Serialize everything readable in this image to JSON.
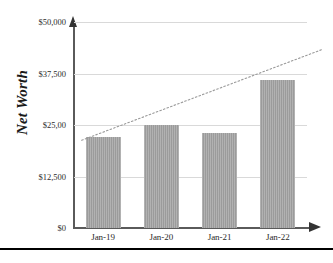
{
  "chart_data": {
    "type": "bar",
    "title": "",
    "subtitle": "",
    "xlabel": "",
    "ylabel": "Net Worth",
    "categories": [
      "Jan-19",
      "Jan-20",
      "Jan-21",
      "Jan-22"
    ],
    "values": [
      22000,
      25000,
      23000,
      36000
    ],
    "series": [
      {
        "name": "Net Worth",
        "values": [
          22000,
          25000,
          23000,
          36000
        ]
      }
    ],
    "ylim": [
      0,
      50000
    ],
    "ytick_values": [
      0,
      12500,
      25000,
      37500,
      50000
    ],
    "ytick_labels": [
      "$0",
      "$12,500",
      "$25,00",
      "$37,500",
      "$50,000"
    ],
    "grid": true,
    "legend": false,
    "legend_position": "none",
    "annotations": [
      {
        "name": "trendline",
        "type": "linear-trend",
        "style": "dotted",
        "start_value": 21300,
        "end_value": 37300
      }
    ],
    "colors": {
      "bar_fill": "#a3a3a3",
      "gridline": "#d9d9d9",
      "axis": "#5a5a5a",
      "axis_arrow": "#333333",
      "text": "#2b2b2b",
      "rule": "#000000"
    }
  },
  "axis": {
    "y_title": "Net Worth"
  }
}
